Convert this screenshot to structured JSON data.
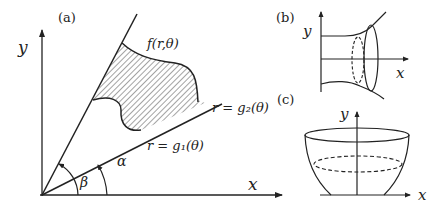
{
  "panels": {
    "a": {
      "label": "(a)",
      "y_axis": "y",
      "x_axis": "x",
      "function_label": "f(r,θ)",
      "curve_upper": "r = g₂(θ)",
      "curve_lower": "r = g₁(θ)",
      "angle_alpha": "α",
      "angle_beta": "β"
    },
    "b": {
      "label": "(b)",
      "y_axis": "y",
      "x_axis": "x"
    },
    "c": {
      "label": "(c)",
      "y_axis": "y",
      "x_axis": "x"
    }
  },
  "colors": {
    "stroke": "#222222",
    "background": "#ffffff"
  }
}
